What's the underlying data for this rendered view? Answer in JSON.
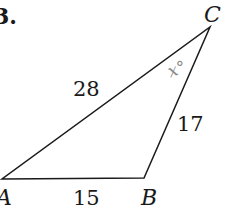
{
  "problem": {
    "number": "3."
  },
  "triangle": {
    "vertices": {
      "A": "A",
      "B": "B",
      "C": "C"
    },
    "sides": {
      "AC": "28",
      "BC": "17",
      "AB": "15"
    },
    "angle_C": "x°"
  },
  "colors": {
    "stroke": "#1a1a1a",
    "angle_label": "#8a8a8a"
  }
}
